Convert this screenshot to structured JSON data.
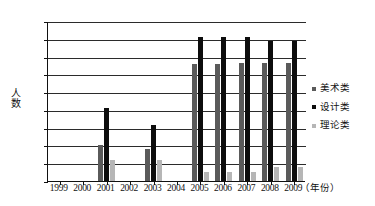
{
  "chart_data": {
    "type": "bar",
    "title": "",
    "xlabel": "（年份）",
    "ylabel": "人数",
    "ylim": [
      0,
      450
    ],
    "ytick_step": 50,
    "yticks": [
      0,
      50,
      100,
      150,
      200,
      250,
      300,
      350,
      400,
      450
    ],
    "grid": true,
    "legend_position": "right",
    "categories": [
      "1999",
      "2000",
      "2001",
      "2002",
      "2003",
      "2004",
      "2005",
      "2006",
      "2007",
      "2008",
      "2009"
    ],
    "series": [
      {
        "name": "美术类",
        "color": "#5a5a5a",
        "values": [
          0,
          0,
          100,
          0,
          90,
          0,
          330,
          330,
          332,
          332,
          332
        ]
      },
      {
        "name": "设计类",
        "color": "#0d0d0d",
        "values": [
          0,
          0,
          205,
          0,
          158,
          0,
          405,
          405,
          405,
          395,
          395
        ]
      },
      {
        "name": "理论类",
        "color": "#b6b6b6",
        "values": [
          0,
          0,
          60,
          0,
          60,
          0,
          25,
          25,
          25,
          40,
          40
        ]
      }
    ]
  }
}
